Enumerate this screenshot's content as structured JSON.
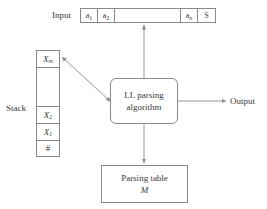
{
  "diagram": {
    "stroke_color": "#8a8a8a",
    "text_color": "#3a3a3a",
    "background_color": "#ffffff"
  },
  "input": {
    "label": "Input",
    "cells": [
      {
        "base": "a",
        "sub": "1"
      },
      {
        "base": "a",
        "sub": "2"
      },
      {
        "base": "",
        "sub": ""
      },
      {
        "base": "a",
        "sub": "n"
      },
      {
        "base": "S",
        "sub": ""
      }
    ]
  },
  "stack": {
    "label": "Stack",
    "cells": [
      {
        "base": "X",
        "sub": "m"
      },
      {
        "base": "",
        "sub": ""
      },
      {
        "base": "X",
        "sub": "2"
      },
      {
        "base": "X",
        "sub": "1"
      },
      {
        "base": "#",
        "sub": ""
      }
    ]
  },
  "algorithm": {
    "line1": "LL parsing",
    "line2": "algorithm"
  },
  "parsing_table": {
    "line1": "Parsing table",
    "line2": "M"
  },
  "output": {
    "label": "Output"
  }
}
